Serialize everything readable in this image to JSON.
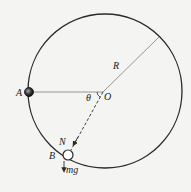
{
  "diagram": {
    "type": "physics-free-body",
    "labels": {
      "point_a": "A",
      "point_b": "B",
      "center": "O",
      "radius": "R",
      "angle": "θ",
      "normal_force": "N",
      "gravity": "mg"
    },
    "colors": {
      "line": "#2a2a2a",
      "radius_line": "#8a8a8a",
      "background": "#f4f4f2",
      "ball_a": "#333333",
      "ball_b": "#ffffff"
    }
  }
}
